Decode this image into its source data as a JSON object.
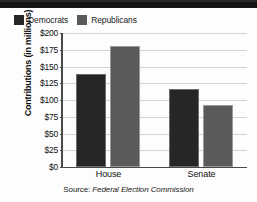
{
  "chart_data": {
    "type": "bar",
    "title": "",
    "xlabel": "",
    "ylabel": "Contributions (in millions)",
    "categories": [
      "House",
      "Senate"
    ],
    "series": [
      {
        "name": "Democrats",
        "values": [
          139,
          116
        ],
        "color": "#262626"
      },
      {
        "name": "Republicans",
        "values": [
          180,
          92
        ],
        "color": "#5a5a5a"
      }
    ],
    "ylim": [
      0,
      200
    ],
    "ytick_values": [
      200,
      175,
      150,
      125,
      100,
      75,
      50,
      25,
      0
    ],
    "ytick_labels": [
      "$200",
      "$175",
      "$150",
      "$125",
      "$100",
      "$75",
      "$50",
      "$25",
      "$0"
    ],
    "grid": true,
    "legend_position": "top-left",
    "source_note": "Source: Federal Election Commission"
  },
  "legend": {
    "items": [
      {
        "label": "Democrats",
        "swatch_color": "#262626"
      },
      {
        "label": "Republicans",
        "swatch_color": "#5a5a5a"
      }
    ]
  },
  "axis": {
    "y_title": "Contributions (in millions)",
    "y_ticks": [
      "$200",
      "$175",
      "$150",
      "$125",
      "$100",
      "$75",
      "$50",
      "$25",
      "$0"
    ],
    "x_categories": [
      "House",
      "Senate"
    ]
  },
  "footer": {
    "source_prefix": "Source: ",
    "source_name": "Federal Election Commission"
  }
}
